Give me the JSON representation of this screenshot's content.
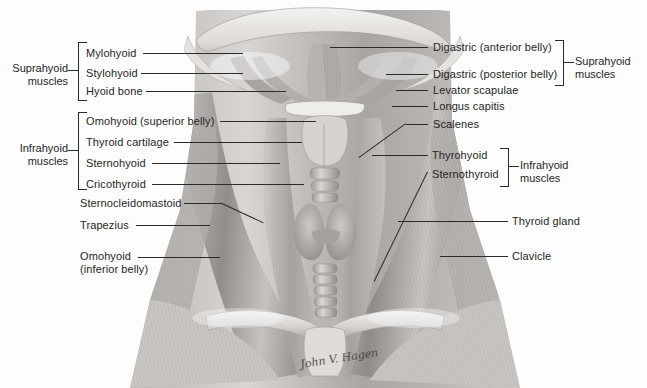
{
  "figure": {
    "background_color": "#fdfdfd",
    "text_color": "#262626",
    "leader_color": "#2b2b2b",
    "signature": "John V. Hagen"
  },
  "groups": {
    "left_suprahyoid": "Suprahyoid\nmuscles",
    "left_infrahyoid": "Infrahyoid\nmuscles",
    "right_suprahyoid": "Suprahyoid\nmuscles",
    "right_infrahyoid": "Infrahyoid\nmuscles"
  },
  "labels_left": [
    {
      "text": "Mylohyoid",
      "group": "suprahyoid"
    },
    {
      "text": "Stylohyoid",
      "group": "suprahyoid"
    },
    {
      "text": "Hyoid bone",
      "group": "suprahyoid"
    },
    {
      "text": "Omohyoid (superior belly)",
      "group": "infrahyoid"
    },
    {
      "text": "Thyroid cartilage",
      "group": "infrahyoid"
    },
    {
      "text": "Sternohyoid",
      "group": "infrahyoid"
    },
    {
      "text": "Cricothyroid",
      "group": "infrahyoid"
    },
    {
      "text": "Sternocleidomastoid",
      "group": ""
    },
    {
      "text": "Trapezius",
      "group": ""
    },
    {
      "text": "Omohyoid\n(inferior belly)",
      "group": ""
    }
  ],
  "labels_right": [
    {
      "text": "Digastric (anterior belly)",
      "group": "suprahyoid"
    },
    {
      "text": "Digastric (posterior belly)",
      "group": "suprahyoid"
    },
    {
      "text": "Levator scapulae",
      "group": ""
    },
    {
      "text": "Longus capitis",
      "group": ""
    },
    {
      "text": "Scalenes",
      "group": ""
    },
    {
      "text": "Thyrohyoid",
      "group": "infrahyoid"
    },
    {
      "text": "Sternothyroid",
      "group": "infrahyoid"
    },
    {
      "text": "Thyroid gland",
      "group": ""
    },
    {
      "text": "Clavicle",
      "group": ""
    }
  ]
}
